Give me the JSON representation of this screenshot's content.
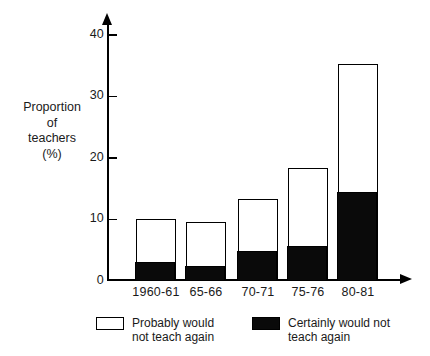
{
  "chart_data": {
    "type": "bar",
    "stacked": true,
    "title": "",
    "subtitle": "",
    "xlabel": "",
    "ylabel": "Proportion of teachers (%)",
    "ylabel_lines": [
      "Proportion",
      "of",
      "teachers",
      "(%)"
    ],
    "categories": [
      "1960-61",
      "65-66",
      "70-71",
      "75-76",
      "80-81"
    ],
    "ylim": [
      0,
      42
    ],
    "yticks": [
      0,
      10,
      20,
      30,
      40
    ],
    "ytick_labels": [
      "0",
      "10",
      "20",
      "30",
      "40"
    ],
    "grid": false,
    "legend_position": "bottom",
    "series": [
      {
        "name": "Certainly would not teach again",
        "legend_lines": [
          "Certainly would not",
          "teach again"
        ],
        "color": "#0a0a0a",
        "swatch": "black",
        "values": [
          3.0,
          2.3,
          4.8,
          5.6,
          14.5
        ]
      },
      {
        "name": "Probably would not teach again",
        "legend_lines": [
          "Probably would",
          "not teach again"
        ],
        "color": "#ffffff",
        "swatch": "white",
        "values": [
          7.0,
          7.2,
          8.4,
          12.6,
          20.6
        ]
      }
    ],
    "totals": [
      10.0,
      9.5,
      13.2,
      18.2,
      35.1
    ]
  },
  "axis": {
    "y_arrow": "up-arrow-icon",
    "x_arrow": "right-arrow-icon"
  }
}
